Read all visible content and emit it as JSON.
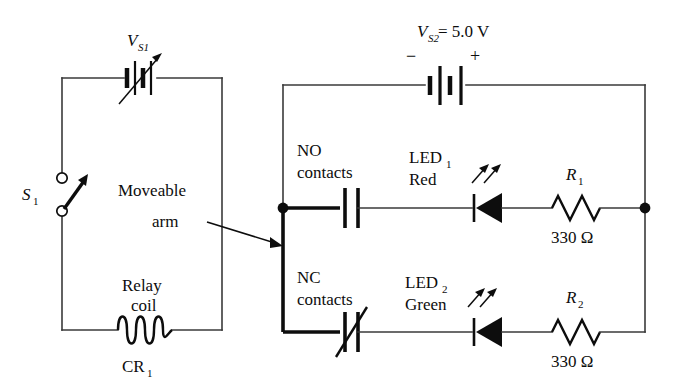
{
  "figure": {
    "background_color": "#ffffff",
    "line_color": "#3a3a3a",
    "symbol_color": "#0d0d0d"
  },
  "left_circuit": {
    "name": "relay coil control loop",
    "source_label": "V",
    "source_sub": "S1",
    "source_type": "variable-dc-source",
    "switch_label": "S",
    "switch_sub": "1",
    "switch_state": "open",
    "coil_caption_line1": "Relay",
    "coil_caption_line2": "coil",
    "coil_designator": "CR",
    "coil_designator_sub": "1",
    "pointer_caption_line1": "Moveable",
    "pointer_caption_line2": "arm"
  },
  "right_circuit": {
    "name": "LED output loop",
    "source_label": "V",
    "source_sub": "S2",
    "source_value": "= 5.0 V",
    "source_minus": "−",
    "source_plus": "+",
    "branches": [
      {
        "contact_line1": "NO",
        "contact_line2": "contacts",
        "contact_type": "normally-open",
        "led_label": "LED",
        "led_sub": "1",
        "led_color_name": "Red",
        "resistor_label": "R",
        "resistor_sub": "1",
        "resistor_value": "330 Ω"
      },
      {
        "contact_line1": "NC",
        "contact_line2": "contacts",
        "contact_type": "normally-closed",
        "led_label": "LED",
        "led_sub": "2",
        "led_color_name": "Green",
        "resistor_label": "R",
        "resistor_sub": "2",
        "resistor_value": "330 Ω"
      }
    ]
  }
}
